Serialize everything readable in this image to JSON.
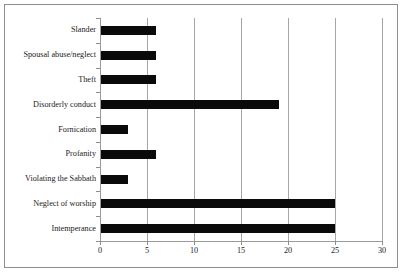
{
  "chart_data": {
    "type": "bar",
    "orientation": "horizontal",
    "title": "",
    "subtitle": "",
    "xlabel": "",
    "ylabel": "",
    "categories": [
      "Slander",
      "Spousal abuse/neglect",
      "Theft",
      "Disorderly conduct",
      "Fornication",
      "Profanity",
      "Violating the Sabbath",
      "Neglect of worship",
      "Intemperance"
    ],
    "values": [
      6,
      6,
      6,
      19,
      3,
      6,
      3,
      25,
      25
    ],
    "xticks": [
      "0",
      "5",
      "10",
      "15",
      "20",
      "25",
      "30"
    ],
    "xtick_values": [
      0,
      5,
      10,
      15,
      20,
      25,
      30
    ],
    "xlim": [
      0,
      30
    ],
    "grid": "vertical",
    "legend": "none",
    "bar_color": "#0a0a0a",
    "gridline_color": "#a6a6a6",
    "frame_color": "#8d8d8d",
    "background_color": "#ffffff"
  }
}
